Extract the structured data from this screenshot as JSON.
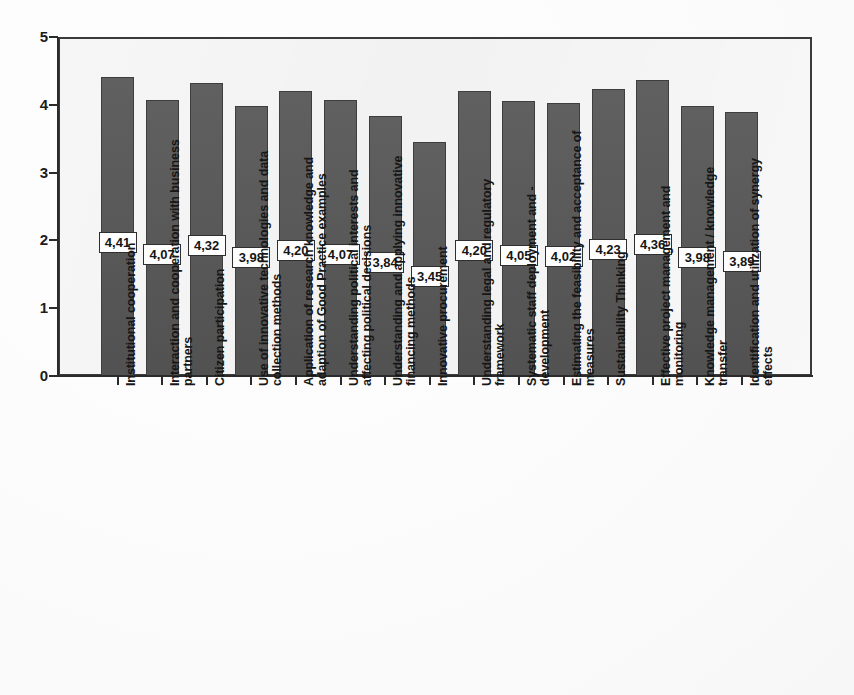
{
  "chart_data": {
    "type": "bar",
    "title": "",
    "subtitle": "",
    "xlabel": "",
    "ylabel": "",
    "ylim": [
      0,
      5
    ],
    "y_ticks": [
      "0",
      "1",
      "2",
      "3",
      "4",
      "5"
    ],
    "grid": false,
    "legend": "none",
    "decimal_separator": ",",
    "bar_color": "#565656",
    "plot_background": "#ececec",
    "axis_color": "#2b2b2b",
    "categories": [
      "Institutional cooperation",
      "Interaction and cooperation with business partners",
      "Citizen participation",
      "Use of innovative technologies and data collection methods",
      "Application of research knowledge and adaption of Good Practice examples",
      "Understanding political interests and affecting political decisions",
      "Understanding and applying innovative financing methods",
      "Innovative procurement",
      "Understanding legal and regulatory framework",
      "Systematic staff deployment and -development",
      "Estimating the feasibility and acceptance of measures",
      "Sustainability Thinking",
      "Effective project management and monitoring",
      "Knowledge management / knowledge transfer",
      "Identification and utilization of synergy effects"
    ],
    "category_lines": [
      [
        "Institutional cooperation"
      ],
      [
        "Interaction and cooperation with business",
        "partners"
      ],
      [
        "Citizen participation"
      ],
      [
        "Use of innovative technologies and data",
        "collection methods"
      ],
      [
        "Application of research knowledge and",
        "adaption of Good Practice examples"
      ],
      [
        "Understanding political interests and",
        "affecting political decisions"
      ],
      [
        "Understanding and applying innovative",
        "financing methods"
      ],
      [
        "Innovative procurement"
      ],
      [
        "Understanding legal and regulatory",
        "framework"
      ],
      [
        "Systematic staff deployment and -",
        "development"
      ],
      [
        "Estimating the feasibility and acceptance of",
        "measures"
      ],
      [
        "Sustainability Thinking"
      ],
      [
        "Effective project management and",
        "monitoring"
      ],
      [
        "Knowledge management / knowledge",
        "transfer"
      ],
      [
        "Identification and utilization of synergy",
        "effects"
      ]
    ],
    "values": [
      4.41,
      4.07,
      4.32,
      3.98,
      4.2,
      4.07,
      3.84,
      3.45,
      4.2,
      4.05,
      4.02,
      4.23,
      4.36,
      3.98,
      3.89
    ],
    "value_labels": [
      "4,41",
      "4,07",
      "4,32",
      "3,98",
      "4,20",
      "4,07",
      "3,84",
      "3,45",
      "4,20",
      "4,05",
      "4,02",
      "4,23",
      "4,36",
      "3,98",
      "3,89"
    ]
  }
}
